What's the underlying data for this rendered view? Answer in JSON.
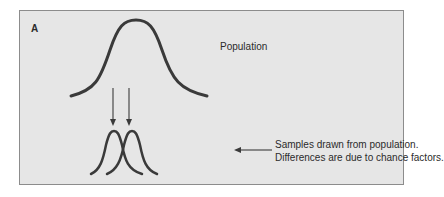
{
  "figure": {
    "panel_label": "A",
    "population_label": "Population",
    "samples_label_line1": "Samples drawn from population.",
    "samples_label_line2": "Differences are due to chance factors.",
    "colors": {
      "background": "#e6e6e6",
      "border": "#8c8c8c",
      "curve": "#3a3a3a",
      "text": "#2b2b2b"
    }
  }
}
